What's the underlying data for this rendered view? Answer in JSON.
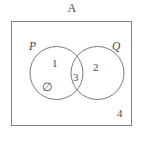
{
  "figure": {
    "title": "A",
    "caption": "",
    "type": "venn-diagram"
  },
  "diagram": {
    "universal_set_shape": "rectangle",
    "sets": [
      {
        "id": "P",
        "label": "P",
        "position": "left"
      },
      {
        "id": "Q",
        "label": "Q",
        "position": "right"
      }
    ],
    "regions": [
      {
        "id": "p-only",
        "label": "1",
        "description": "P only"
      },
      {
        "id": "q-only",
        "label": "2",
        "description": "Q only"
      },
      {
        "id": "intersection",
        "label": "3",
        "description": "P intersect Q"
      },
      {
        "id": "outside",
        "label": "4",
        "description": "outside P and Q"
      },
      {
        "id": "empty-set",
        "label": "∅",
        "description": "empty set symbol inside P only"
      }
    ]
  },
  "colors": {
    "stroke": "#808080",
    "circle_stroke": "#7a7a7a",
    "text": "#4a4a4a"
  }
}
